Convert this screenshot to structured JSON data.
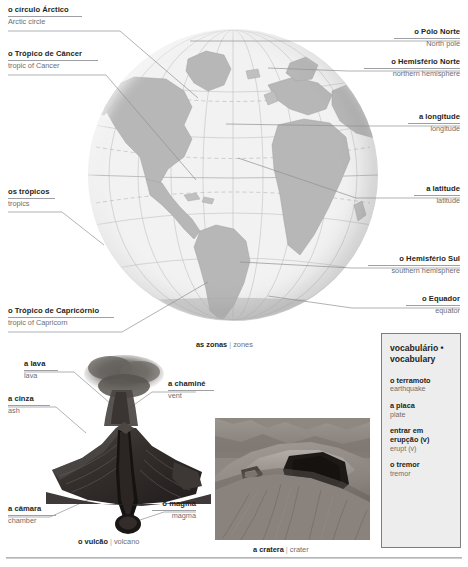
{
  "globe": {
    "caption_pt": "as zonas",
    "caption_en": "zones",
    "labels": [
      {
        "id": "arctic-circle",
        "pt": "o círculo Árctico",
        "en": "Arctic circle"
      },
      {
        "id": "tropic-of-cancer",
        "pt": "o Trópico de Câncer",
        "en": "tropic of Cancer"
      },
      {
        "id": "tropics",
        "pt": "os trópicos",
        "en": "tropics"
      },
      {
        "id": "tropic-of-capricorn",
        "pt": "o Trópico de Capricórnio",
        "en": "tropic of Capricorn"
      },
      {
        "id": "north-pole",
        "pt": "o Pólo Norte",
        "en": "North pole"
      },
      {
        "id": "northern-hemisphere",
        "pt": "o Hemisfério Norte",
        "en": "northern hemisphere"
      },
      {
        "id": "longitude",
        "pt": "a longitude",
        "en": "longitude"
      },
      {
        "id": "latitude",
        "pt": "a latitude",
        "en": "latitude"
      },
      {
        "id": "southern-hemisphere",
        "pt": "o Hemisfério Sul",
        "en": "southern hemisphere"
      },
      {
        "id": "equator",
        "pt": "o Equador",
        "en": "equator"
      }
    ]
  },
  "volcano": {
    "caption_pt": "o vulcão",
    "caption_en": "volcano",
    "labels": [
      {
        "id": "lava",
        "pt": "a lava",
        "en": "lava"
      },
      {
        "id": "ash",
        "pt": "a cinza",
        "en": "ash"
      },
      {
        "id": "vent",
        "pt": "a chaminé",
        "en": "vent"
      },
      {
        "id": "chamber",
        "pt": "a câmara",
        "en": "chamber"
      },
      {
        "id": "magma",
        "pt": "o magma",
        "en": "magma"
      }
    ]
  },
  "crater": {
    "caption_pt": "a cratera",
    "caption_en": "crater"
  },
  "vocabulary": {
    "title_pt": "vocabulário •",
    "title_en": "vocabulary",
    "items": [
      {
        "pt": "o terramoto",
        "en": "earthquake"
      },
      {
        "pt": "a placa",
        "en": "plate"
      },
      {
        "pt": "entrar em erupção (v)",
        "en": "erupt (v)"
      },
      {
        "pt": "o tremor",
        "en": "tremor"
      }
    ]
  },
  "colors": {
    "text_pt": "#231f20",
    "text_en": "#6d6e71",
    "rule": "#9d9fa2",
    "leader": "#8e9093",
    "vocab_bg": "#ededed",
    "vocab_border": "#7b7d80",
    "land": "#b7b7b7",
    "ocean": "#f0f0f0"
  }
}
